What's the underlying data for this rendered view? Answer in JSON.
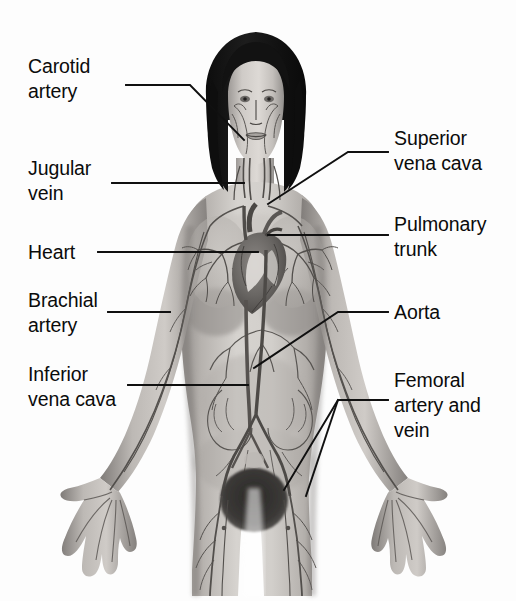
{
  "figure": {
    "background_color": "#fdfdfd",
    "label_color": "#0b0b0b",
    "leader_line_color": "#101010",
    "width": 516,
    "height": 601
  },
  "labels": {
    "carotid_artery": "Carotid\nartery",
    "jugular_vein": "Jugular\nvein",
    "heart": "Heart",
    "brachial_artery": "Brachial\nartery",
    "inferior_vena_cava": "Inferior\nvena cava",
    "superior_vena_cava": "Superior\nvena cava",
    "pulmonary_trunk": "Pulmonary\ntrunk",
    "aorta": "Aorta",
    "femoral_artery_and_vein": "Femoral\nartery and\nvein"
  },
  "label_positions": {
    "carotid_artery": {
      "x": 28,
      "y": 54
    },
    "jugular_vein": {
      "x": 28,
      "y": 156
    },
    "heart": {
      "x": 28,
      "y": 245
    },
    "brachial_artery": {
      "x": 28,
      "y": 288
    },
    "inferior_vena_cava": {
      "x": 28,
      "y": 362
    },
    "superior_vena_cava": {
      "x": 394,
      "y": 126
    },
    "pulmonary_trunk": {
      "x": 394,
      "y": 212
    },
    "aorta": {
      "x": 394,
      "y": 302
    },
    "femoral_artery_and_vein": {
      "x": 394,
      "y": 368
    }
  },
  "anatomy_parts": [
    "head-and-hair",
    "face-vessels",
    "neck-carotid-jugular",
    "shoulders",
    "lungs-pulmonary-vessels",
    "heart",
    "aorta-and-inferior-vena-cava",
    "abdominal-vessels",
    "arms-brachial-vessels",
    "hands-and-fingers",
    "pelvis-and-femoral-vessels",
    "thighs"
  ],
  "colors": {
    "skin_light": "#d9d6d2",
    "skin_mid": "#b9b5b1",
    "skin_dark": "#8e8a87",
    "shadow": "#6f6c69",
    "hair": "#141414",
    "vessel": "#55514f",
    "vessel_dark": "#3a3635",
    "heart_dark": "#4f4b49",
    "heart_light": "#e8e5e2",
    "outline": "#101010"
  }
}
